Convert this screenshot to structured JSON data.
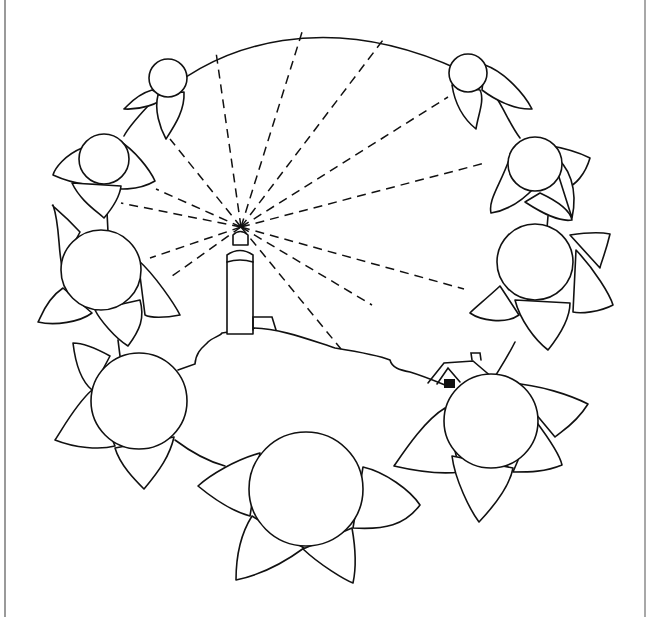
{
  "colors": {
    "ink": "#111111",
    "paper": "#ffffff",
    "border": "#9a9a9a"
  },
  "scene": {
    "wreath_arc": "M 152 104 C 220 40, 330 10, 460 70",
    "wreath_stems": [
      "M 148 106 C 135 120, 128 128, 124 136",
      "M 494 94 C 505 110, 510 125, 520 138",
      "M 107 212 L 108 232",
      "M 548 216 L 547 228",
      "M 118 340 L 120 356",
      "M 515 342 C 505 362, 497 372, 492 382",
      "M 175 440 C 195 455, 210 462, 225 466",
      "M 395 465 L 410 458"
    ],
    "flowers": [
      {
        "id": "top-left-small",
        "cx": 168,
        "cy": 78,
        "r": 19,
        "petals": [
          "M 152 90 C 135 95, 128 106, 124 109 C 140 110, 160 104, 165 96 Z",
          "M 158 95 C 154 110, 160 128, 166 139 C 175 125, 185 110, 184 92 Z"
        ]
      },
      {
        "id": "top-right-small",
        "cx": 468,
        "cy": 73,
        "r": 19,
        "petals": [
          "M 485 65 C 505 72, 525 95, 532 109 C 515 110, 495 100, 482 90 Z",
          "M 452 85 C 455 105, 465 120, 476 129 C 478 115, 485 100, 480 90 Z"
        ]
      },
      {
        "id": "left-upper",
        "cx": 104,
        "cy": 159,
        "r": 25,
        "petals": [
          "M 82 148 C 65 155, 55 168, 53 175 C 75 185, 100 188, 110 180 Z",
          "M 118 140 C 135 150, 150 170, 155 181 C 140 190, 115 192, 100 184 Z",
          "M 72 183 C 80 200, 95 210, 104 218 C 115 205, 120 195, 121 186 Z"
        ]
      },
      {
        "id": "right-upper",
        "cx": 535,
        "cy": 164,
        "r": 27,
        "petals": [
          "M 546 145 C 565 148, 580 153, 590 158 C 585 175, 575 185, 568 187 Z",
          "M 509 160 C 500 185, 488 200, 491 213 C 510 210, 525 198, 535 187 Z",
          "M 540 193 C 555 200, 570 210, 572 220 C 560 222, 545 215, 525 202 Z",
          "M 552 155 C 570 165, 578 190, 572 218 Z"
        ]
      },
      {
        "id": "left-middle",
        "cx": 101,
        "cy": 270,
        "r": 40,
        "petals": [
          "M 80 232 C 60 210, 50 205, 53 205 C 60 225, 58 250, 62 266 Z",
          "M 63 288 C 45 300, 40 320, 38 322 C 55 326, 80 322, 92 313 Z",
          "M 138 260 C 155 275, 175 305, 180 315 C 165 318, 150 318, 145 315 Z",
          "M 95 310 C 100 320, 115 338, 128 346 C 140 330, 145 318, 140 300 Z"
        ]
      },
      {
        "id": "right-middle",
        "cx": 535,
        "cy": 262,
        "r": 38,
        "petals": [
          "M 570 235 C 590 232, 600 232, 610 234 C 605 255, 600 265, 600 268 Z",
          "M 576 250 C 595 270, 610 295, 613 305 C 600 312, 580 314, 573 312 Z",
          "M 500 286 C 485 300, 472 310, 470 313 C 480 320, 505 325, 519 315 Z",
          "M 515 300 C 520 320, 535 340, 548 350 C 560 335, 570 318, 570 303 Z"
        ]
      },
      {
        "id": "left-lower",
        "cx": 139,
        "cy": 401,
        "r": 48,
        "petals": [
          "M 110 356 C 90 345, 78 343, 73 343 C 75 360, 80 380, 92 390 Z",
          "M 92 390 C 75 405, 62 430, 55 440 C 75 448, 100 450, 115 446 Z",
          "M 115 448 C 120 465, 135 480, 144 489 C 160 470, 170 455, 174 437 Z"
        ]
      },
      {
        "id": "right-lower",
        "cx": 491,
        "cy": 421,
        "r": 47,
        "petals": [
          "M 510 383 C 540 385, 570 395, 588 404 C 575 425, 560 432, 555 437 Z",
          "M 535 420 C 550 440, 560 455, 562 465 C 545 472, 530 472, 513 472 Z",
          "M 445 408 C 425 420, 405 450, 394 466 C 420 472, 445 474, 460 472 Z",
          "M 452 456 C 455 480, 470 510, 479 522 C 495 505, 510 485, 513 468 Z"
        ]
      },
      {
        "id": "bottom-center",
        "cx": 306,
        "cy": 489,
        "r": 57,
        "petals": [
          "M 260 453 C 235 460, 210 475, 198 486 C 215 500, 235 512, 250 516 Z",
          "M 363 467 C 385 472, 410 490, 420 505 C 405 525, 385 530, 353 528 Z",
          "M 252 516 C 240 535, 236 560, 236 580 C 260 575, 285 562, 304 548 Z",
          "M 303 549 C 320 565, 345 580, 353 583 C 357 565, 355 545, 352 528 Z"
        ]
      }
    ],
    "lighthouse": {
      "lamp": "M 233 245 L 233 235 Q 240 228, 248 235 L 248 245 Z",
      "tower": "M 227 334 L 227 255 Q 240 246, 253 255 L 253 334 Z",
      "band": "M 227 262 Q 240 258, 253 262",
      "annex": "M 253 330 L 253 317 L 272 317 L 276 330",
      "focus": {
        "x": 241,
        "y": 227
      }
    },
    "hill": "M 178 370 L 195 364 C 196 350, 205 346, 208 342 C 212 338, 220 336, 222 333 C 230 332, 240 330, 250 328 C 280 328, 310 340, 335 348 C 360 352, 378 355, 390 360 C 392 368, 400 370, 410 372 C 420 375, 428 378, 445 385",
    "house": {
      "roof": "M 428 383 L 444 363 L 473 361 L 493 378",
      "gable": "M 437 384 L 448 368 L 460 382",
      "chimney": "M 472 360 L 471 353 L 480 353 L 481 360",
      "window": {
        "x": 444,
        "y": 379,
        "w": 11,
        "h": 9
      }
    },
    "rays": [
      {
        "x2": 216,
        "y2": 52
      },
      {
        "x2": 303,
        "y2": 29
      },
      {
        "x2": 383,
        "y2": 40
      },
      {
        "x2": 448,
        "y2": 97
      },
      {
        "x2": 485,
        "y2": 163
      },
      {
        "x2": 464,
        "y2": 289
      },
      {
        "x2": 372,
        "y2": 305
      },
      {
        "x2": 341,
        "y2": 349
      },
      {
        "x2": 170,
        "y2": 139
      },
      {
        "x2": 156,
        "y2": 189
      },
      {
        "x2": 121,
        "y2": 203
      },
      {
        "x2": 150,
        "y2": 258
      },
      {
        "x2": 168,
        "y2": 279
      }
    ]
  }
}
